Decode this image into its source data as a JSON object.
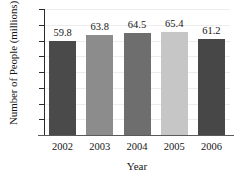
{
  "chart_data": {
    "type": "bar",
    "title": "",
    "xlabel": "Year",
    "ylabel": "Number of People (millions)",
    "categories": [
      "2002",
      "2003",
      "2004",
      "2005",
      "2006"
    ],
    "values": [
      59.8,
      63.8,
      64.5,
      65.4,
      61.2
    ],
    "value_labels": [
      "59.8",
      "63.8",
      "64.5",
      "65.4",
      "61.2"
    ],
    "ylim": [
      0,
      80
    ],
    "yticks": [
      80,
      70,
      60,
      50,
      40,
      30,
      20,
      10
    ],
    "ytick_labels": [
      "80",
      "70",
      "60",
      "50",
      "40",
      "30",
      "20",
      "10"
    ],
    "grid": true,
    "legend": false,
    "bar_colors": [
      "#4a4a4a",
      "#8c8c8c",
      "#6e6e6e",
      "#c6c6c6",
      "#474747"
    ],
    "axis_color": "#2b2b2b",
    "grid_color": "#ededed",
    "background": "#ffffff"
  }
}
